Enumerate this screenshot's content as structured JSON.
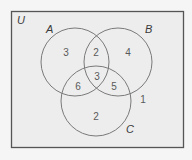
{
  "universe": {
    "label": "U",
    "rect": {
      "x": 11.5,
      "y": 11.5,
      "width": 172,
      "height": 136
    },
    "fill": "#ededed",
    "stroke": "#555555"
  },
  "sets": [
    {
      "id": "A",
      "label": "A",
      "cx": 75,
      "cy": 62,
      "r": 34,
      "label_x": 46,
      "label_y": 33
    },
    {
      "id": "B",
      "label": "B",
      "cx": 118,
      "cy": 62,
      "r": 34,
      "label_x": 145,
      "label_y": 33
    },
    {
      "id": "C",
      "label": "C",
      "cx": 96,
      "cy": 101,
      "r": 35,
      "label_x": 126,
      "label_y": 133
    }
  ],
  "circle_stroke": "#7a7a7a",
  "regions": [
    {
      "name": "A-only",
      "value": "3",
      "x": 66,
      "y": 56
    },
    {
      "name": "A-and-B-only",
      "value": "2",
      "x": 96,
      "y": 56
    },
    {
      "name": "B-only",
      "value": "4",
      "x": 128,
      "y": 56
    },
    {
      "name": "A-and-B-and-C",
      "value": "3",
      "x": 97,
      "y": 80
    },
    {
      "name": "A-and-C-only",
      "value": "6",
      "x": 78,
      "y": 90
    },
    {
      "name": "B-and-C-only",
      "value": "5",
      "x": 114,
      "y": 90
    },
    {
      "name": "C-only",
      "value": "2",
      "x": 96,
      "y": 120
    },
    {
      "name": "outside-all",
      "value": "1",
      "x": 143,
      "y": 103
    }
  ]
}
